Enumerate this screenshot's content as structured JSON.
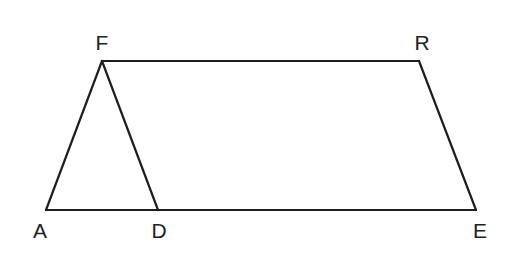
{
  "diagram": {
    "type": "geometry",
    "stroke_color": "#1e1e1e",
    "label_color": "#222222",
    "points": [
      {
        "id": "F",
        "label": "F",
        "x": 102,
        "y": 61,
        "label_x": 102,
        "label_y": 50
      },
      {
        "id": "R",
        "label": "R",
        "x": 419,
        "y": 61,
        "label_x": 422,
        "label_y": 50
      },
      {
        "id": "A",
        "label": "A",
        "x": 46,
        "y": 210,
        "label_x": 40,
        "label_y": 238
      },
      {
        "id": "D",
        "label": "D",
        "x": 158,
        "y": 210,
        "label_x": 159,
        "label_y": 238
      },
      {
        "id": "E",
        "label": "E",
        "x": 476,
        "y": 210,
        "label_x": 480,
        "label_y": 238
      }
    ],
    "segments": [
      {
        "from": "F",
        "to": "R"
      },
      {
        "from": "R",
        "to": "E"
      },
      {
        "from": "A",
        "to": "E"
      },
      {
        "from": "A",
        "to": "F"
      },
      {
        "from": "F",
        "to": "D"
      }
    ]
  }
}
